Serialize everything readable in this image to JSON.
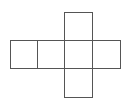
{
  "diagram": {
    "type": "cube-net",
    "stroke_color": "#555555",
    "background": "#ffffff",
    "cells": [
      {
        "id": "row-1",
        "x": 10,
        "y": 40,
        "w": 28,
        "h": 29
      },
      {
        "id": "row-2",
        "x": 37,
        "y": 40,
        "w": 28,
        "h": 29
      },
      {
        "id": "row-3",
        "x": 64,
        "y": 40,
        "w": 29,
        "h": 29
      },
      {
        "id": "row-4",
        "x": 92,
        "y": 40,
        "w": 29,
        "h": 29
      },
      {
        "id": "top",
        "x": 64,
        "y": 12,
        "w": 29,
        "h": 29
      },
      {
        "id": "bottom",
        "x": 64,
        "y": 68,
        "w": 29,
        "h": 30
      }
    ]
  }
}
